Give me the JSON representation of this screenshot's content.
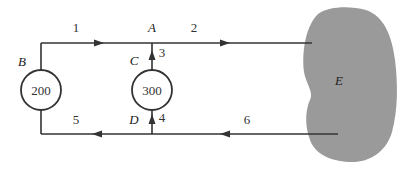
{
  "diagram": {
    "type": "flow-network",
    "nodes": [
      {
        "id": "B",
        "label": "B",
        "value": "200"
      },
      {
        "id": "C",
        "label": "C",
        "value": "300"
      },
      {
        "id": "A",
        "label": "A"
      },
      {
        "id": "D",
        "label": "D"
      },
      {
        "id": "E",
        "label": "E"
      }
    ],
    "edges": [
      {
        "id": "1",
        "label": "1",
        "from": "B",
        "to": "A"
      },
      {
        "id": "2",
        "label": "2",
        "from": "A",
        "to": "E"
      },
      {
        "id": "3",
        "label": "3",
        "from": "C",
        "to": "A"
      },
      {
        "id": "4",
        "label": "4",
        "from": "D",
        "to": "C"
      },
      {
        "id": "5",
        "label": "5",
        "from": "D",
        "to": "B"
      },
      {
        "id": "6",
        "label": "6",
        "from": "E",
        "to": "D"
      }
    ],
    "colors": {
      "line": "#333333",
      "region": "#9a9a9a",
      "background": "#ffffff"
    }
  }
}
